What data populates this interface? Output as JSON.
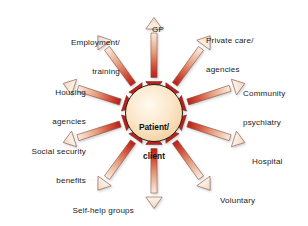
{
  "diagram": {
    "type": "radial-hub-and-spoke",
    "background_color": "#ffffff",
    "center": {
      "label": "Patient/\nclient",
      "line1": "Patient/",
      "line2": "client",
      "fill_light": "#fdf0dc",
      "fill_mid": "#f8dcb4",
      "stroke": "#2b2118"
    },
    "arrow_style": {
      "kind": "double-headed",
      "outer_head": "hollow-light",
      "inner_head": "solid-dark-red",
      "outer_color": "#f6e3d2",
      "mid_color": "#e8a489",
      "inner_color": "#c0241b",
      "outline_color": "#7c4a38",
      "count": 10
    },
    "spokes": [
      {
        "id": "gp",
        "label": "GP",
        "angle_deg": 90,
        "label_lines": [
          "GP"
        ]
      },
      {
        "id": "private-care-agencies",
        "label": "Private care/ agencies",
        "angle_deg": 54,
        "label_lines": [
          "Private care/",
          "agencies"
        ]
      },
      {
        "id": "community-psychiatry",
        "label": "Community psychiatry",
        "angle_deg": 18,
        "label_lines": [
          "Community",
          "psychiatry"
        ]
      },
      {
        "id": "hospital",
        "label": "Hospital",
        "angle_deg": -18,
        "label_lines": [
          "Hospital"
        ]
      },
      {
        "id": "voluntary-organizations",
        "label": "Voluntary organizations",
        "angle_deg": -54,
        "label_lines": [
          "Voluntary",
          "organizations"
        ]
      },
      {
        "id": "social-work",
        "label": "Social work",
        "angle_deg": -90,
        "label_lines": [
          "Social work"
        ]
      },
      {
        "id": "self-help-groups",
        "label": "Self-help groups",
        "angle_deg": -126,
        "label_lines": [
          "Self-help groups"
        ]
      },
      {
        "id": "social-security-benefits",
        "label": "Social security benefits",
        "angle_deg": -162,
        "label_lines": [
          "Social security",
          "benefits"
        ]
      },
      {
        "id": "housing-agencies",
        "label": "Housing agencies",
        "angle_deg": 162,
        "label_lines": [
          "Housing",
          "agencies"
        ]
      },
      {
        "id": "employment-training",
        "label": "Employment/ training",
        "angle_deg": 126,
        "label_lines": [
          "Employment/",
          "training"
        ]
      }
    ]
  },
  "labels": {
    "gp_l1": "GP",
    "private_l1": "Private care/",
    "private_l2": "agencies",
    "community_l1": "Community",
    "community_l2": "psychiatry",
    "hospital_l1": "Hospital",
    "voluntary_l1": "Voluntary",
    "voluntary_l2": "organizations",
    "socialwork_l1": "Social work",
    "selfhelp_l1": "Self-help groups",
    "socsec_l1": "Social security",
    "socsec_l2": "benefits",
    "housing_l1": "Housing",
    "housing_l2": "agencies",
    "employment_l1": "Employment/",
    "employment_l2": "training",
    "center_l1": "Patient/",
    "center_l2": "client"
  }
}
